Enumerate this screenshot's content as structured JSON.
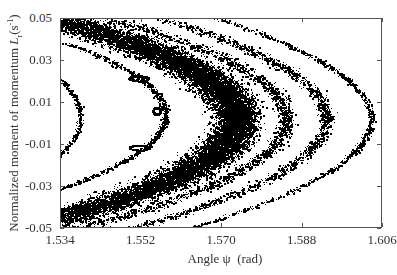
{
  "chart_data": {
    "type": "scatter",
    "title": "",
    "xlabel": "Angle ψ  (rad)",
    "ylabel": "Normalized moment of momentum L_r (s^-1)",
    "ylabel_parts": {
      "main": "Normalized moment of momentum ",
      "symbol": "L",
      "sub": "r",
      "unit_open": "(s",
      "unit_sup": "-1",
      "unit_close": ")"
    },
    "xlim": [
      1.534,
      1.606
    ],
    "ylim": [
      -0.05,
      0.05
    ],
    "xticks": [
      1.534,
      1.552,
      1.57,
      1.588,
      1.606
    ],
    "xtick_labels": [
      "1.534",
      "1.552",
      "1.570",
      "1.588",
      "1.606"
    ],
    "yticks": [
      0.05,
      0.03,
      0.01,
      -0.01,
      -0.03,
      -0.05
    ],
    "ytick_labels": [
      "0.05",
      "0.03",
      "0.01",
      "-0.01",
      "-0.03",
      "-0.05"
    ],
    "grid": false,
    "legend": null,
    "marker_color": "#000000",
    "bands": [
      {
        "name": "inner-curve-1",
        "vertex_psi": 1.5385,
        "L0": 0.003,
        "c": 14,
        "width": 0.0006,
        "L_range": [
          -0.032,
          0.036
        ],
        "points": 500
      },
      {
        "name": "inner-curve-2",
        "vertex_psi": 1.5575,
        "L0": 0.004,
        "c": 19,
        "width": 0.0008,
        "L_range": [
          -0.032,
          0.038
        ],
        "points": 900
      },
      {
        "name": "main-chaotic-band",
        "vertex_psi": 1.5735,
        "L0": 0.002,
        "c": 18,
        "width": 0.0045,
        "L_range": [
          -0.05,
          0.05
        ],
        "points": 16000
      },
      {
        "name": "outer-band-1",
        "vertex_psi": 1.5845,
        "L0": 0.002,
        "c": 17,
        "width": 0.0018,
        "L_range": [
          -0.05,
          0.05
        ],
        "points": 1800
      },
      {
        "name": "outer-band-2",
        "vertex_psi": 1.5935,
        "L0": 0.002,
        "c": 16,
        "width": 0.0015,
        "L_range": [
          -0.05,
          0.05
        ],
        "points": 1500
      },
      {
        "name": "outer-band-3",
        "vertex_psi": 1.6035,
        "L0": 0.002,
        "c": 15,
        "width": 0.0008,
        "L_range": [
          -0.05,
          0.05
        ],
        "points": 900
      }
    ],
    "islands": [
      {
        "name": "center-ring",
        "psi": 1.5555,
        "L": 0.006,
        "rpsi": 0.0008,
        "rL": 0.0017,
        "points": 120
      },
      {
        "name": "upper-island",
        "psi": 1.5515,
        "L": 0.0215,
        "rpsi": 0.0022,
        "rL": 0.0012,
        "points": 90
      },
      {
        "name": "lower-island",
        "psi": 1.5515,
        "L": -0.0115,
        "rpsi": 0.0022,
        "rL": 0.0012,
        "points": 90
      }
    ]
  }
}
